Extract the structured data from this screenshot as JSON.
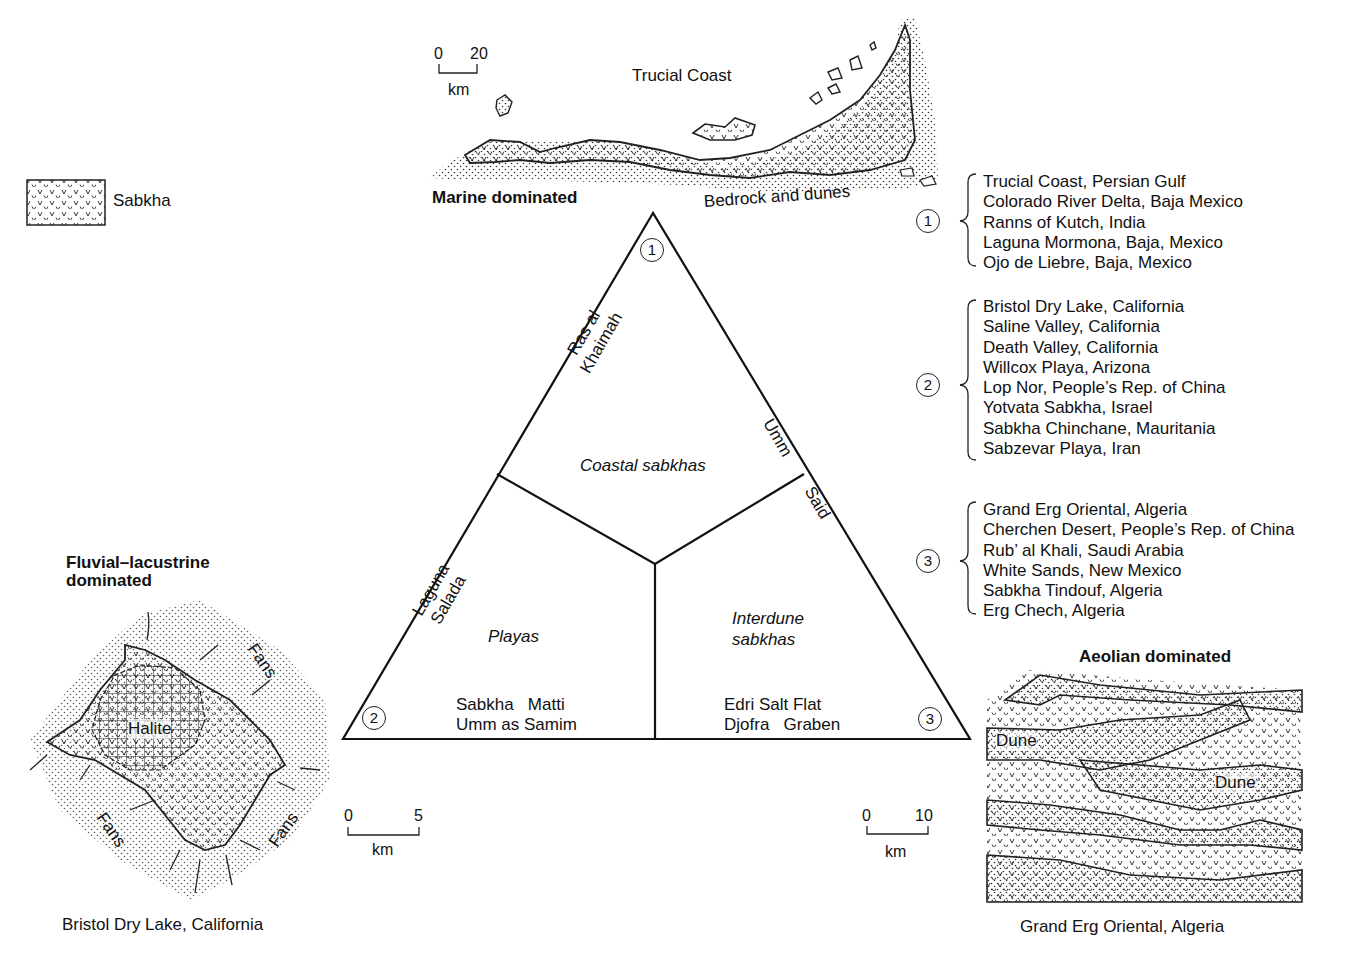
{
  "legend": {
    "sabkha_label": "Sabkha"
  },
  "marine": {
    "heading": "Marine dominated",
    "map_title": "Trucial Coast",
    "map_note": "Bedrock and dunes",
    "scale": {
      "start": "0",
      "end": "20",
      "unit": "km"
    }
  },
  "fluvial": {
    "heading_line1": "Fluvial–lacustrine",
    "heading_line2": "dominated",
    "halite_label": "Halite",
    "fans_label": "Fans",
    "caption": "Bristol Dry Lake, California",
    "scale": {
      "start": "0",
      "end": "5",
      "unit": "km"
    }
  },
  "aeolian": {
    "heading": "Aeolian dominated",
    "dune_label": "Dune",
    "caption": "Grand Erg Oriental, Algeria",
    "scale": {
      "start": "0",
      "end": "10",
      "unit": "km"
    }
  },
  "triangle": {
    "vertices": [
      "1",
      "2",
      "3"
    ],
    "fields": {
      "coastal": "Coastal sabkhas",
      "playas": "Playas",
      "interdune_line1": "Interdune",
      "interdune_line2": "sabkhas"
    },
    "edge_labels": {
      "ras_line1": "Ras al",
      "ras_line2": "Khaimah",
      "umm": "Umm",
      "said": "Said",
      "laguna_line1": "Laguna",
      "laguna_line2": "Salada"
    },
    "examples": {
      "playas": [
        "Sabkha   Matti",
        "Umm as Samim"
      ],
      "interdune": [
        "Edri Salt Flat",
        "Djofra   Graben"
      ]
    }
  },
  "groups": [
    {
      "number": "1",
      "items": [
        "Trucial Coast, Persian Gulf",
        "Colorado River Delta, Baja Mexico",
        "Ranns of Kutch, India",
        "Laguna Mormona, Baja, Mexico",
        "Ojo de Liebre, Baja, Mexico"
      ]
    },
    {
      "number": "2",
      "items": [
        "Bristol Dry Lake, California",
        "Saline Valley, California",
        "Death Valley, California",
        "Willcox Playa, Arizona",
        "Lop Nor, People’s Rep. of China",
        "Yotvata Sabkha, Israel",
        "Sabkha Chinchane, Mauritania",
        "Sabzevar Playa, Iran"
      ]
    },
    {
      "number": "3",
      "items": [
        "Grand Erg Oriental, Algeria",
        "Cherchen Desert, People’s Rep. of China",
        "Rub’ al Khali, Saudi Arabia",
        "White Sands, New Mexico",
        "Sabkha Tindouf, Algeria",
        "Erg Chech, Algeria"
      ]
    }
  ]
}
